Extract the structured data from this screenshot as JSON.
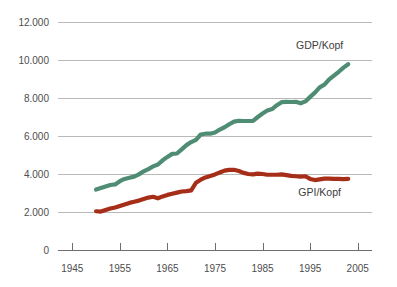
{
  "chart_data": {
    "type": "line",
    "title": "",
    "xlabel": "",
    "ylabel": "",
    "xlim": [
      1942,
      2008
    ],
    "ylim": [
      0,
      12000
    ],
    "grid": true,
    "legend_position": "inline-right",
    "y_ticks": [
      0,
      2000,
      4000,
      6000,
      8000,
      10000,
      12000
    ],
    "y_tick_labels": [
      "0",
      "2.000",
      "4.000",
      "6.000",
      "8.000",
      "10.000",
      "12.000"
    ],
    "x_ticks": [
      1945,
      1955,
      1965,
      1975,
      1985,
      1995,
      2005
    ],
    "x_tick_labels": [
      "1945",
      "1955",
      "1965",
      "1975",
      "1985",
      "1995",
      "2005"
    ],
    "series": [
      {
        "name": "GDP/Kopf",
        "color": "#4e8c73",
        "label_x": 1997,
        "label_y": 10600,
        "x": [
          1950,
          1951,
          1952,
          1953,
          1954,
          1955,
          1956,
          1957,
          1958,
          1959,
          1960,
          1961,
          1962,
          1963,
          1964,
          1965,
          1966,
          1967,
          1968,
          1969,
          1970,
          1971,
          1972,
          1973,
          1974,
          1975,
          1976,
          1977,
          1978,
          1979,
          1980,
          1981,
          1982,
          1983,
          1984,
          1985,
          1986,
          1987,
          1988,
          1989,
          1990,
          1991,
          1992,
          1993,
          1994,
          1995,
          1996,
          1997,
          1998,
          1999,
          2000,
          2001,
          2002,
          2003
        ],
        "y": [
          3180,
          3260,
          3340,
          3420,
          3450,
          3620,
          3740,
          3800,
          3860,
          3980,
          4140,
          4260,
          4400,
          4500,
          4720,
          4900,
          5060,
          5080,
          5300,
          5520,
          5680,
          5800,
          6080,
          6120,
          6120,
          6180,
          6340,
          6460,
          6620,
          6760,
          6800,
          6790,
          6790,
          6800,
          7000,
          7180,
          7340,
          7420,
          7620,
          7780,
          7800,
          7790,
          7800,
          7720,
          7820,
          8060,
          8280,
          8560,
          8700,
          8980,
          9180,
          9380,
          9600,
          9780
        ]
      },
      {
        "name": "GPI/Kopf",
        "color": "#a62d17",
        "label_x": 1997,
        "label_y": 2820,
        "x": [
          1950,
          1951,
          1952,
          1953,
          1954,
          1955,
          1956,
          1957,
          1958,
          1959,
          1960,
          1961,
          1962,
          1963,
          1964,
          1965,
          1966,
          1967,
          1968,
          1969,
          1970,
          1971,
          1972,
          1973,
          1974,
          1975,
          1976,
          1977,
          1978,
          1979,
          1980,
          1981,
          1982,
          1983,
          1984,
          1985,
          1986,
          1987,
          1988,
          1989,
          1990,
          1991,
          1992,
          1993,
          1994,
          1995,
          1996,
          1997,
          1998,
          1999,
          2000,
          2001,
          2002,
          2003
        ],
        "y": [
          2040,
          2020,
          2100,
          2180,
          2240,
          2320,
          2400,
          2480,
          2540,
          2600,
          2680,
          2760,
          2800,
          2720,
          2820,
          2900,
          2960,
          3020,
          3080,
          3100,
          3140,
          3540,
          3700,
          3820,
          3900,
          3980,
          4080,
          4180,
          4220,
          4220,
          4160,
          4060,
          4000,
          3980,
          4020,
          4000,
          3960,
          3960,
          3960,
          3980,
          3940,
          3900,
          3880,
          3860,
          3880,
          3740,
          3680,
          3720,
          3760,
          3760,
          3740,
          3740,
          3730,
          3740
        ]
      }
    ]
  }
}
